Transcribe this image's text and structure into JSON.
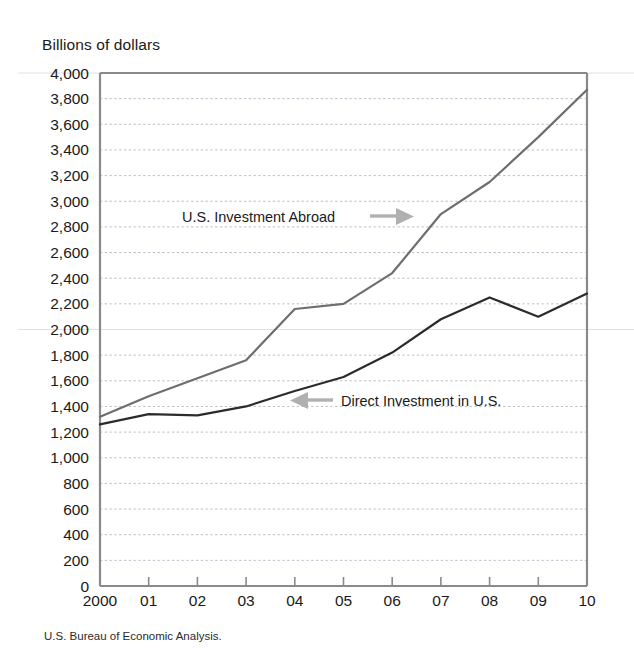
{
  "figure": {
    "axis_title": "Billions of dollars",
    "source_note": "U.S. Bureau of Economic Analysis."
  },
  "annotations": {
    "abroad_label": "U.S. Investment Abroad",
    "direct_label": "Direct Investment in U.S.",
    "abroad_arrow_icon": "arrow-right-icon",
    "direct_arrow_icon": "arrow-left-icon"
  },
  "colors": {
    "abroad_line": "#6e6e6e",
    "direct_line": "#2b2b2b",
    "grid": "#b9b9c9",
    "frame": "#8a8a8a",
    "arrow": "#b0b0b0",
    "background": "#ffffff"
  },
  "chart_data": {
    "type": "line",
    "title": "",
    "subtitle": "",
    "xlabel": "",
    "ylabel": "Billions of dollars",
    "grid": true,
    "legend_position": "inline-annotations",
    "x": [
      2000,
      2001,
      2002,
      2003,
      2004,
      2005,
      2006,
      2007,
      2008,
      2009,
      2010
    ],
    "xtick_labels": [
      "2000",
      "01",
      "02",
      "03",
      "04",
      "05",
      "06",
      "07",
      "08",
      "09",
      "10"
    ],
    "xlim": [
      2000,
      2010
    ],
    "ylim": [
      0,
      4000
    ],
    "ytick_labels": [
      "0",
      "200",
      "400",
      "600",
      "800",
      "1,000",
      "1,200",
      "1,400",
      "1,600",
      "1,800",
      "2,000",
      "2,200",
      "2,400",
      "2,600",
      "2,800",
      "3,000",
      "3,200",
      "3,400",
      "3,600",
      "3,800",
      "4,000"
    ],
    "ytick_values": [
      0,
      200,
      400,
      600,
      800,
      1000,
      1200,
      1400,
      1600,
      1800,
      2000,
      2200,
      2400,
      2600,
      2800,
      3000,
      3200,
      3400,
      3600,
      3800,
      4000
    ],
    "series": [
      {
        "name": "U.S. Investment Abroad",
        "color": "#6e6e6e",
        "values": [
          1320,
          1480,
          1620,
          1760,
          2160,
          2200,
          2440,
          2900,
          3150,
          3500,
          3870
        ]
      },
      {
        "name": "Direct Investment in U.S.",
        "color": "#2b2b2b",
        "values": [
          1260,
          1340,
          1330,
          1400,
          1520,
          1630,
          1820,
          2080,
          2250,
          2100,
          2280
        ]
      }
    ]
  }
}
